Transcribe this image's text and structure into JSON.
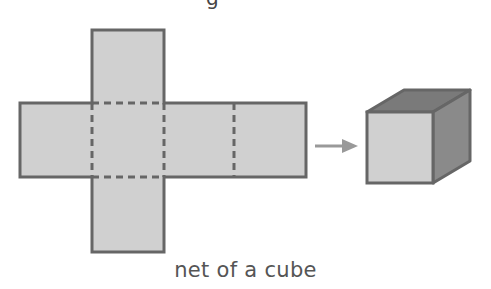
{
  "figure": {
    "caption": "net of a cube",
    "top_fragment": "g",
    "colors": {
      "face_fill": "#d0d0d0",
      "outline": "#666666",
      "cube_top": "#7a7a7a",
      "cube_side": "#8a8a8a",
      "arrow": "#999999",
      "caption": "#555555"
    },
    "net": {
      "faces": [
        {
          "name": "top",
          "x": 92,
          "y": 30,
          "w": 72,
          "h": 73
        },
        {
          "name": "left",
          "x": 20,
          "y": 103,
          "w": 72,
          "h": 74
        },
        {
          "name": "center",
          "x": 92,
          "y": 103,
          "w": 72,
          "h": 74
        },
        {
          "name": "right",
          "x": 164,
          "y": 103,
          "w": 70,
          "h": 74
        },
        {
          "name": "far-right",
          "x": 234,
          "y": 103,
          "w": 72,
          "h": 74
        },
        {
          "name": "bottom",
          "x": 92,
          "y": 177,
          "w": 72,
          "h": 75
        }
      ],
      "fold_lines": "dashed"
    },
    "arrow": {
      "x1": 315,
      "y1": 146,
      "x2": 357,
      "y2": 146
    },
    "cube": {
      "front": {
        "x": 367,
        "y": 112,
        "w": 66,
        "h": 71
      },
      "depth_dx": 37,
      "depth_dy": -22
    }
  }
}
